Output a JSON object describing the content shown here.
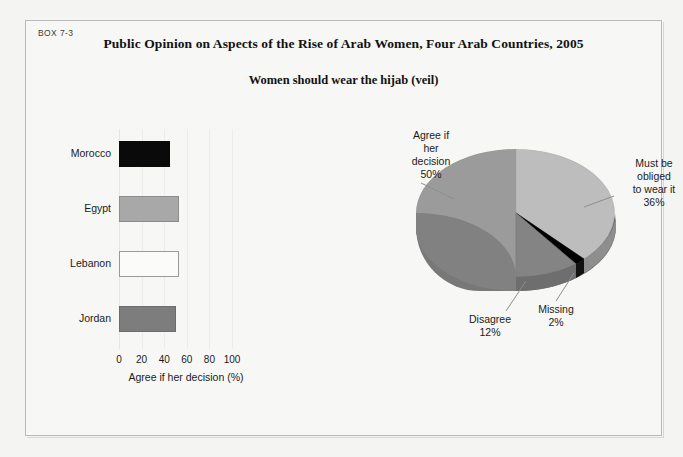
{
  "box": {
    "label": "BOX 7-3",
    "title": "Public Opinion on Aspects of the Rise of Arab Women, Four Arab Countries, 2005",
    "subtitle": "Women should wear the hijab (veil)"
  },
  "chart_data": [
    {
      "type": "bar",
      "orientation": "horizontal",
      "title": "Women should wear the hijab (veil)",
      "categories": [
        "Morocco",
        "Egypt",
        "Lebanon",
        "Jordan"
      ],
      "values": [
        45,
        53,
        53,
        50
      ],
      "colors": [
        "#0a0a0a",
        "#a8a8a8",
        "#fbfbf9",
        "#7d7d7d"
      ],
      "xlabel": "Agree if her decision (%)",
      "ylabel": "",
      "xticks": [
        0,
        20,
        40,
        60,
        80,
        100
      ],
      "xlim": [
        0,
        100
      ],
      "grid": true,
      "legend": "none"
    },
    {
      "type": "pie",
      "title": "Women should wear the hijab (veil)",
      "three_d": true,
      "labels": [
        "Agree if her decision",
        "Must be obliged to wear it",
        "Missing",
        "Disagree"
      ],
      "values": [
        50,
        36,
        2,
        12
      ],
      "value_labels": [
        "50%",
        "36%",
        "2%",
        "12%"
      ],
      "colors": [
        "#9b9b9b",
        "#bdbdbd",
        "#000000",
        "#848484"
      ],
      "legend": "callout-labels"
    }
  ],
  "bar_chart": {
    "xlabel": "Agree if her decision (%)",
    "ticks": [
      "0",
      "20",
      "40",
      "60",
      "80",
      "100"
    ],
    "bars": [
      {
        "label": "Morocco",
        "value": 45,
        "color": "#0a0a0a",
        "border": "#0a0a0a"
      },
      {
        "label": "Egypt",
        "value": 53,
        "color": "#a8a8a8",
        "border": "#8d8d8d"
      },
      {
        "label": "Lebanon",
        "value": 53,
        "color": "#fbfbf9",
        "border": "#9a9a9a"
      },
      {
        "label": "Jordan",
        "value": 50,
        "color": "#7d7d7d",
        "border": "#6c6c6c"
      }
    ]
  },
  "pie_chart": {
    "slices": [
      {
        "name": "agree-if-her-decision",
        "l1": "Agree if",
        "l2": "her",
        "l3": "decision",
        "pct": "50%"
      },
      {
        "name": "must-be-obliged",
        "l1": "Must be",
        "l2": "obliged",
        "l3": "to wear it",
        "pct": "36%"
      },
      {
        "name": "missing",
        "l1": "Missing",
        "l2": "",
        "l3": "",
        "pct": "2%"
      },
      {
        "name": "disagree",
        "l1": "Disagree",
        "l2": "",
        "l3": "",
        "pct": "12%"
      }
    ]
  }
}
